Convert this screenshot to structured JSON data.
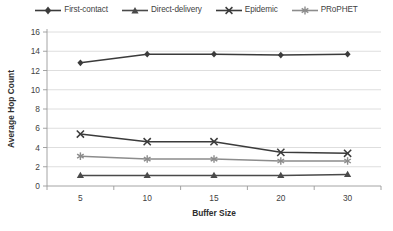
{
  "chart_data": {
    "type": "line",
    "title": "",
    "xlabel": "Buffer Size",
    "ylabel": "Average Hop Count",
    "categories": [
      "5",
      "10",
      "15",
      "20",
      "30"
    ],
    "ylim": [
      0,
      16
    ],
    "ytick_step": 2,
    "yticks": [
      "0",
      "2",
      "4",
      "6",
      "8",
      "10",
      "12",
      "14",
      "16"
    ],
    "grid": "horizontal",
    "legend_position": "top-center",
    "series": [
      {
        "name": "First-contact",
        "marker": "diamond",
        "color": "#3b3b3b",
        "values": [
          12.8,
          13.7,
          13.7,
          13.6,
          13.7
        ]
      },
      {
        "name": "Direct-delivery",
        "marker": "triangle",
        "color": "#4a4a4a",
        "values": [
          1.1,
          1.1,
          1.1,
          1.1,
          1.2
        ]
      },
      {
        "name": "Epidemic",
        "marker": "cross-x",
        "color": "#3b3b3b",
        "values": [
          5.4,
          4.6,
          4.6,
          3.5,
          3.4
        ]
      },
      {
        "name": "PRoPHET",
        "marker": "asterisk",
        "color": "#8c8c8c",
        "values": [
          3.1,
          2.8,
          2.8,
          2.6,
          2.6
        ]
      }
    ]
  },
  "legend": {
    "items": [
      {
        "label": "First-contact"
      },
      {
        "label": "Direct-delivery"
      },
      {
        "label": "Epidemic"
      },
      {
        "label": "PRoPHET"
      }
    ]
  },
  "axes": {
    "y_title": "Average Hop Count",
    "x_title": "Buffer Size"
  }
}
